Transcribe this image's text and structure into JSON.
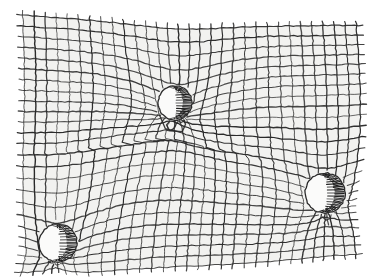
{
  "figure": {
    "title": "Spacetime curvature grid with three masses",
    "type": "line-art-diagram",
    "style": "hand-drawn pen hatching",
    "background_color": "#ffffff",
    "sheet_tint_color": "#f2f2f0",
    "line_color": "#2a2a2a",
    "hatch_color": "#1c1c1c",
    "sphere_fill_color": "#fbfbfa",
    "width": 375,
    "height": 279
  },
  "grid": {
    "label": "deformed-mesh",
    "u_lines": 30,
    "v_lines": 24,
    "u_spacing_px": 11,
    "v_spacing_px": 11,
    "line_width_px": 1.1,
    "overshoot_px": 5,
    "sheet_corners": [
      [
        22,
        14
      ],
      [
        355,
        24
      ],
      [
        360,
        252
      ],
      [
        18,
        268
      ]
    ]
  },
  "masses": [
    {
      "name": "upper-center-sphere",
      "cx": 175,
      "cy": 103,
      "r": 17,
      "well_depth": 30,
      "well_radius": 78,
      "hatch_side": "right",
      "hatch_lines": 22
    },
    {
      "name": "right-sphere",
      "cx": 325,
      "cy": 193,
      "r": 20,
      "well_depth": 26,
      "well_radius": 74,
      "hatch_side": "right",
      "hatch_lines": 24
    },
    {
      "name": "lower-left-sphere",
      "cx": 58,
      "cy": 243,
      "r": 19,
      "well_depth": 24,
      "well_radius": 70,
      "hatch_side": "right",
      "hatch_lines": 22
    }
  ],
  "ridge": {
    "name": "central-saddle-fold",
    "cx": 150,
    "cy": 150,
    "amplitude": 16,
    "radius": 95
  }
}
